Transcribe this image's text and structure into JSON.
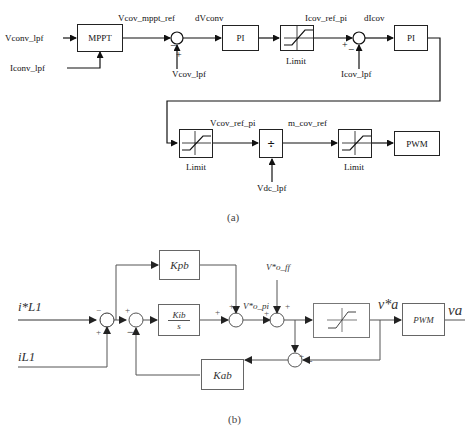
{
  "diagram_a": {
    "caption": "(a)",
    "inputs": {
      "vconv": "Vconv_lpf",
      "iconv": "Iconv_lpf",
      "vcov": "Vcov_lpf",
      "icov": "Icov_lpf",
      "vdc": "Vdc_lpf"
    },
    "signals": {
      "vcov_mppt_ref": "Vcov_mppt_ref",
      "dvconv": "dVconv",
      "icov_ref_pi": "Icov_ref_pi",
      "dicov": "dIcov",
      "vcov_ref_pi": "Vcov_ref_pi",
      "m_cov_ref": "m_cov_ref"
    },
    "blocks": {
      "mppt": "MPPT",
      "pi1": "PI",
      "pi2": "PI",
      "limit": "Limit",
      "divide": "÷",
      "pwm": "PWM"
    },
    "signs": {
      "minus": "−",
      "plus": "+"
    }
  },
  "diagram_b": {
    "caption": "(b)",
    "inputs": {
      "iref": "i*L1",
      "iL1": "iL1",
      "vff": "V*o_ff"
    },
    "signals": {
      "vpi": "V*o_pi",
      "va_star": "v*a",
      "va": "va"
    },
    "blocks": {
      "kpb": "Kpb",
      "kib": "Kib",
      "s": "s",
      "kab": "Kab",
      "pwm": "PWM"
    },
    "signs": {
      "minus": "−",
      "plus": "+"
    }
  }
}
